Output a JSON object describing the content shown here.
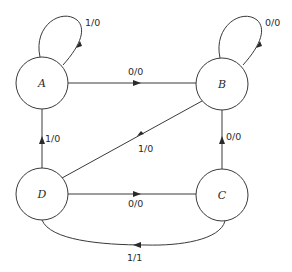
{
  "diagram": {
    "type": "state-diagram",
    "states": [
      {
        "id": "A",
        "label": "A"
      },
      {
        "id": "B",
        "label": "B"
      },
      {
        "id": "C",
        "label": "C"
      },
      {
        "id": "D",
        "label": "D"
      }
    ],
    "transitions": [
      {
        "from": "A",
        "to": "A",
        "label": "1/0"
      },
      {
        "from": "A",
        "to": "B",
        "label": "0/0"
      },
      {
        "from": "B",
        "to": "B",
        "label": "0/0"
      },
      {
        "from": "B",
        "to": "D",
        "label": "1/0"
      },
      {
        "from": "D",
        "to": "A",
        "label": "1/0"
      },
      {
        "from": "D",
        "to": "C",
        "label": "0/0"
      },
      {
        "from": "C",
        "to": "B",
        "label": "0/0"
      },
      {
        "from": "C",
        "to": "D",
        "label": "1/1"
      }
    ]
  }
}
